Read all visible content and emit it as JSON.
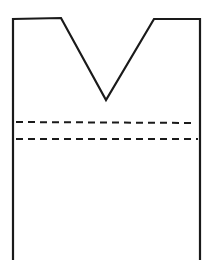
{
  "diagram": {
    "stroke_color": "#1a1a1a",
    "background": "#ffffff",
    "outline": {
      "points": "13,260 13,19 61,18 106,100 154,19 200,19 200,260",
      "stroke_width": 2.2
    },
    "dashed_lines": [
      {
        "x1": 16,
        "y1": 122,
        "x2": 196,
        "y2": 123,
        "dash": "7,5"
      },
      {
        "x1": 16,
        "y1": 139,
        "x2": 198,
        "y2": 139,
        "dash": "7,5"
      }
    ]
  }
}
